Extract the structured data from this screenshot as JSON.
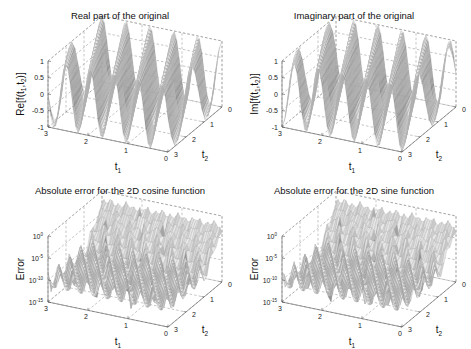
{
  "chart_data": [
    {
      "type": "surface",
      "title": "Real part of the original",
      "xlabel": "t1",
      "ylabel": "t2",
      "zlabel": "Re[f(t1,t2)]",
      "xlim": [
        0,
        3
      ],
      "ylim": [
        0,
        3
      ],
      "zlim": [
        -1,
        1
      ],
      "xticks": [
        "0",
        "1",
        "2",
        "3"
      ],
      "yticks": [
        "0",
        "1",
        "2",
        "3"
      ],
      "zticks": [
        "-1",
        "-0.5",
        "0",
        "0.5",
        "1"
      ],
      "zscale": "linear",
      "function": "cos(2*pi*(f1*t1 + f2*t2))",
      "ridges_along_t1": 5,
      "grid": true
    },
    {
      "type": "surface",
      "title": "Imaginary part of the original",
      "xlabel": "t1",
      "ylabel": "t2",
      "zlabel": "Im[f(t1,t2)]",
      "xlim": [
        0,
        3
      ],
      "ylim": [
        0,
        3
      ],
      "zlim": [
        -1,
        1
      ],
      "xticks": [
        "0",
        "1",
        "2",
        "3"
      ],
      "yticks": [
        "0",
        "1",
        "2",
        "3"
      ],
      "zticks": [
        "-1",
        "-0.5",
        "0",
        "0.5",
        "1"
      ],
      "zscale": "linear",
      "function": "sin(2*pi*(f1*t1 + f2*t2))",
      "ridges_along_t1": 5,
      "grid": true
    },
    {
      "type": "surface",
      "title": "Absolute error for the 2D cosine function",
      "xlabel": "t1",
      "ylabel": "t2",
      "zlabel": "Error",
      "xlim": [
        0,
        3
      ],
      "ylim": [
        0,
        3
      ],
      "zlim": [
        -15,
        0
      ],
      "xticks": [
        "0",
        "1",
        "2",
        "3"
      ],
      "yticks": [
        "0",
        "1",
        "2",
        "3"
      ],
      "zticks": [
        "10^-15",
        "10^-10",
        "10^-5",
        "10^0"
      ],
      "zscale": "log",
      "error_floor_log10": -10,
      "error_peak_log10": -1,
      "ridges_along_t1": 9,
      "grid": true
    },
    {
      "type": "surface",
      "title": "Absolute error for the 2D sine function",
      "xlabel": "t1",
      "ylabel": "t2",
      "zlabel": "Error",
      "xlim": [
        0,
        3
      ],
      "ylim": [
        0,
        3
      ],
      "zlim": [
        -15,
        0
      ],
      "xticks": [
        "0",
        "1",
        "2",
        "3"
      ],
      "yticks": [
        "0",
        "1",
        "2",
        "3"
      ],
      "zticks": [
        "10^-15",
        "10^-10",
        "10^-5",
        "10^0"
      ],
      "zscale": "log",
      "error_floor_log10": -10,
      "error_peak_log10": -1,
      "ridges_along_t1": 9,
      "grid": true
    }
  ]
}
